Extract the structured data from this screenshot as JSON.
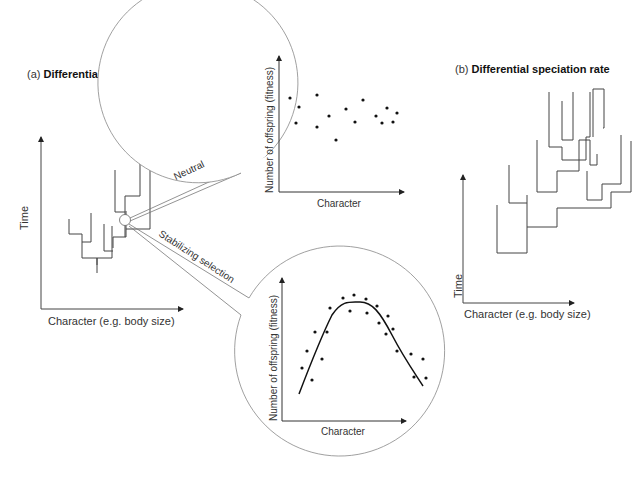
{
  "panel_a": {
    "prefix": "(a)",
    "title": "Differential extinction rate",
    "y_axis_label": "Time",
    "x_axis_label": "Character (e.g. body size)"
  },
  "panel_b": {
    "prefix": "(b)",
    "title": "Differential speciation rate",
    "y_axis_label": "Time",
    "x_axis_label": "Character (e.g. body size)"
  },
  "callouts": {
    "neutral_label": "Neutral",
    "stabilizing_label": "Stabilizing selection"
  },
  "inset_neutral": {
    "y_axis_label": "Number of offspring (fitness)",
    "x_axis_label": "Character",
    "points": [
      [
        290,
        98
      ],
      [
        296,
        123
      ],
      [
        299,
        107
      ],
      [
        317,
        95
      ],
      [
        317,
        127
      ],
      [
        329,
        116
      ],
      [
        336,
        140
      ],
      [
        346,
        109
      ],
      [
        355,
        122
      ],
      [
        363,
        100
      ],
      [
        376,
        116
      ],
      [
        382,
        123
      ],
      [
        387,
        108
      ],
      [
        393,
        122
      ],
      [
        397,
        113
      ]
    ]
  },
  "inset_stabilizing": {
    "y_axis_label": "Number of offspring (fitness)",
    "x_axis_label": "Character",
    "points": [
      [
        302,
        368
      ],
      [
        307,
        351
      ],
      [
        312,
        380
      ],
      [
        315,
        332
      ],
      [
        322,
        359
      ],
      [
        327,
        332
      ],
      [
        330,
        308
      ],
      [
        343,
        298
      ],
      [
        350,
        311
      ],
      [
        354,
        295
      ],
      [
        366,
        299
      ],
      [
        367,
        313
      ],
      [
        377,
        306
      ],
      [
        379,
        323
      ],
      [
        388,
        316
      ],
      [
        386,
        334
      ],
      [
        393,
        329
      ],
      [
        397,
        351
      ],
      [
        411,
        354
      ],
      [
        414,
        377
      ],
      [
        423,
        359
      ],
      [
        426,
        378
      ]
    ],
    "curve": "M299,394 C312,360 322,335 332,315 C342,300 350,302 360,302 C372,302 380,312 392,335 C404,358 414,372 423,386"
  },
  "colors": {
    "line": "#444444",
    "circle": "#888888",
    "dot": "#111111",
    "background": "#ffffff"
  }
}
